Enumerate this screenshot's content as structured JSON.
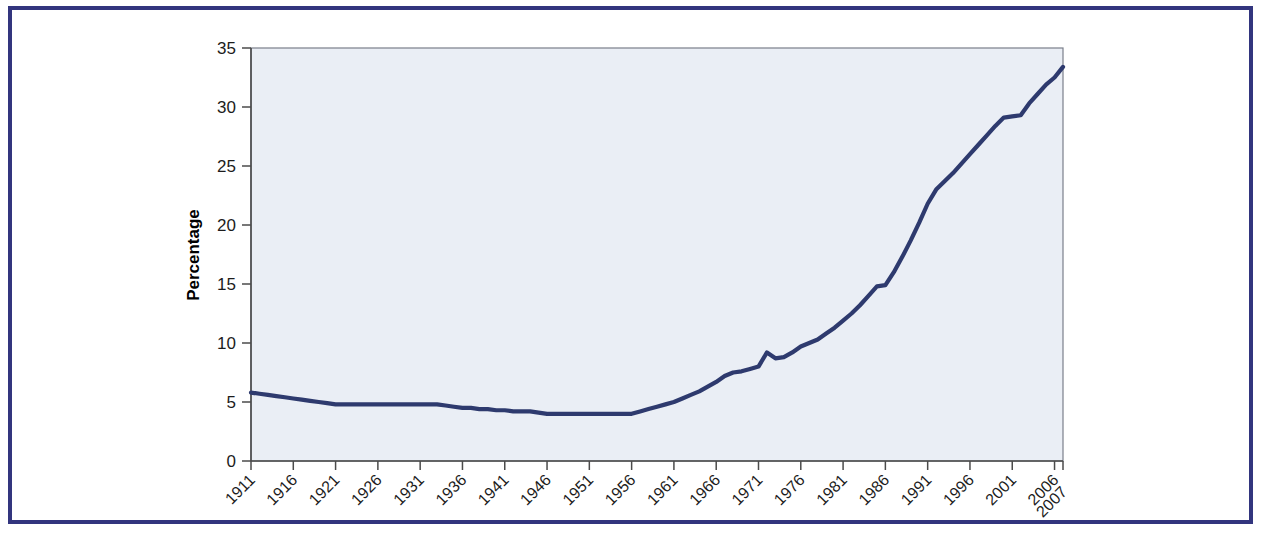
{
  "figure": {
    "frame_color": "#32357e",
    "background_color": "#ffffff"
  },
  "chart_data": {
    "type": "line",
    "title": "",
    "subtitle": "",
    "xlabel": "",
    "ylabel": "Percentage",
    "grid": false,
    "legend": null,
    "line_color": "#2e3a6e",
    "plot_background": "#eaeef5",
    "xlim": [
      1911,
      2007
    ],
    "ylim": [
      0,
      35
    ],
    "yticks": [
      0,
      5,
      10,
      15,
      20,
      25,
      30,
      35
    ],
    "ytick_labels": [
      "0",
      "5",
      "10",
      "15",
      "20",
      "25",
      "30",
      "35"
    ],
    "xticks": [
      1911,
      1916,
      1921,
      1926,
      1931,
      1936,
      1941,
      1946,
      1951,
      1956,
      1961,
      1966,
      1971,
      1976,
      1981,
      1986,
      1991,
      1996,
      2001,
      2006,
      2007
    ],
    "xtick_labels": [
      "1911",
      "1916",
      "1921",
      "1926",
      "1931",
      "1936",
      "1941",
      "1946",
      "1951",
      "1956",
      "1961",
      "1966",
      "1971",
      "1976",
      "1981",
      "1986",
      "1991",
      "1996",
      "2001",
      "2006",
      "2007"
    ],
    "xtick_rotation": 45,
    "series": [
      {
        "name": "Percentage",
        "x": [
          1911,
          1912,
          1913,
          1914,
          1915,
          1916,
          1917,
          1918,
          1919,
          1920,
          1921,
          1922,
          1923,
          1924,
          1925,
          1926,
          1927,
          1928,
          1929,
          1930,
          1931,
          1932,
          1933,
          1934,
          1935,
          1936,
          1937,
          1938,
          1939,
          1940,
          1941,
          1942,
          1943,
          1944,
          1945,
          1946,
          1947,
          1948,
          1949,
          1950,
          1951,
          1952,
          1953,
          1954,
          1955,
          1956,
          1957,
          1958,
          1959,
          1960,
          1961,
          1962,
          1963,
          1964,
          1965,
          1966,
          1967,
          1968,
          1969,
          1970,
          1971,
          1972,
          1973,
          1974,
          1975,
          1976,
          1977,
          1978,
          1979,
          1980,
          1981,
          1982,
          1983,
          1984,
          1985,
          1986,
          1987,
          1988,
          1989,
          1990,
          1991,
          1992,
          1993,
          1994,
          1995,
          1996,
          1997,
          1998,
          1999,
          2000,
          2001,
          2002,
          2003,
          2004,
          2005,
          2006,
          2007
        ],
        "values": [
          5.8,
          5.7,
          5.6,
          5.5,
          5.4,
          5.3,
          5.2,
          5.1,
          5.0,
          4.9,
          4.8,
          4.8,
          4.8,
          4.8,
          4.8,
          4.8,
          4.8,
          4.8,
          4.8,
          4.8,
          4.8,
          4.8,
          4.8,
          4.7,
          4.6,
          4.5,
          4.5,
          4.4,
          4.4,
          4.3,
          4.3,
          4.2,
          4.2,
          4.2,
          4.1,
          4.0,
          4.0,
          4.0,
          4.0,
          4.0,
          4.0,
          4.0,
          4.0,
          4.0,
          4.0,
          4.0,
          4.2,
          4.4,
          4.6,
          4.8,
          5.0,
          5.3,
          5.6,
          5.9,
          6.3,
          6.7,
          7.2,
          7.5,
          7.6,
          7.8,
          8.0,
          9.2,
          8.7,
          8.8,
          9.2,
          9.7,
          10.0,
          10.3,
          10.8,
          11.3,
          11.9,
          12.5,
          13.2,
          14.0,
          14.8,
          14.9,
          16.0,
          17.3,
          18.7,
          20.2,
          21.8,
          23.0,
          23.7,
          24.4,
          25.2,
          26.0,
          26.8,
          27.6,
          28.4,
          29.1,
          29.2,
          29.3,
          30.3,
          31.1,
          31.9,
          32.5,
          33.4
        ]
      }
    ]
  },
  "axis": {
    "y_title": "Percentage"
  }
}
